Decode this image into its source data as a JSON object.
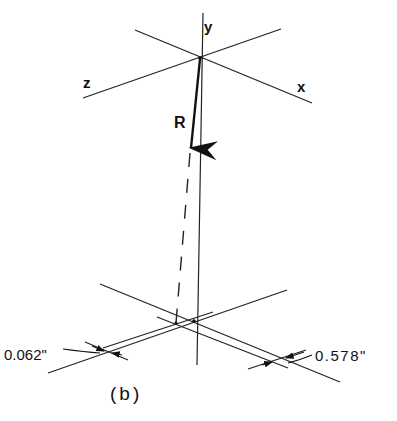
{
  "figure": {
    "caption": "(b)",
    "upper_axes": {
      "labels": {
        "y": "y",
        "z": "z",
        "x": "x"
      }
    },
    "vector": {
      "label": "R"
    },
    "dimensions": [
      {
        "label": "0.062\""
      },
      {
        "label": "0.578\""
      }
    ]
  },
  "colors": {
    "line": "#222222",
    "background": "#ffffff"
  }
}
